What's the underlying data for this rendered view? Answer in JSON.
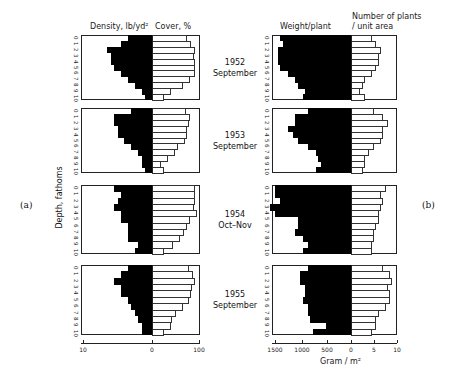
{
  "figure": {
    "panel_a_label": "(a)",
    "panel_b_label": "(b)",
    "y_axis_label": "Depth, fathoms",
    "left_header_density": "Density, lb/yd²",
    "left_header_cover": "Cover, %",
    "right_header_weight": "Weight/plant",
    "right_header_number_line1": "Number of plants",
    "right_header_number_line2": "/ unit area",
    "right_x_label": "Gram / m²",
    "depth_ticks": [
      "0",
      "1",
      "2",
      "3",
      "4",
      "5",
      "6",
      "7",
      "8",
      "9",
      "10"
    ],
    "left_x_ticks": [
      {
        "label": "10",
        "x": 83
      },
      {
        "label": "0",
        "x": 152
      },
      {
        "label": "100",
        "x": 199
      }
    ],
    "right_x_ticks": [
      {
        "label": "1500",
        "x": 275
      },
      {
        "label": "1000",
        "x": 302
      },
      {
        "label": "500",
        "x": 327
      },
      {
        "label": "0",
        "x": 351
      },
      {
        "label": "5",
        "x": 374
      },
      {
        "label": "10",
        "x": 397
      }
    ],
    "dates": [
      {
        "year": "1952",
        "period": "September"
      },
      {
        "year": "1953",
        "period": "September"
      },
      {
        "year": "1954",
        "period": "Oct–Nov"
      },
      {
        "year": "1955",
        "period": "September"
      }
    ]
  },
  "chart_data": [
    {
      "type": "bar",
      "title": "(a) Density (lb/yd²) and Cover (%) by depth",
      "orientation": "horizontal",
      "ylabel": "Depth, fathoms",
      "categories": [
        "0",
        "1",
        "2",
        "3",
        "4",
        "5",
        "6",
        "7",
        "8",
        "9",
        "10"
      ],
      "xlim_density": [
        0,
        10
      ],
      "xlim_cover": [
        0,
        100
      ],
      "panels": [
        {
          "label": "1952 September",
          "series": [
            {
              "name": "Density, lb/yd²",
              "values": [
                3.5,
                4.5,
                6.5,
                6.0,
                6.0,
                5.5,
                4.5,
                3.5,
                2.5,
                1.5,
                1.0
              ]
            },
            {
              "name": "Cover, %",
              "values": [
                75,
                82,
                92,
                90,
                92,
                92,
                92,
                80,
                65,
                40,
                25
              ]
            }
          ]
        },
        {
          "label": "1953 September",
          "series": [
            {
              "name": "Density, lb/yd²",
              "values": [
                3.0,
                5.5,
                5.5,
                5.0,
                5.0,
                4.0,
                3.0,
                2.0,
                1.5,
                1.5,
                1.0
              ]
            },
            {
              "name": "Cover, %",
              "values": [
                72,
                80,
                78,
                75,
                75,
                70,
                55,
                48,
                35,
                20,
                25
              ]
            }
          ]
        },
        {
          "label": "1954 Oct-Nov",
          "series": [
            {
              "name": "Density, lb/yd²",
              "values": [
                5.5,
                4.5,
                5.0,
                5.5,
                4.5,
                4.5,
                3.5,
                3.5,
                3.5,
                2.0,
                2.5
              ]
            },
            {
              "name": "Cover, %",
              "values": [
                92,
                92,
                92,
                90,
                95,
                80,
                75,
                68,
                60,
                45,
                25
              ]
            }
          ]
        },
        {
          "label": "1955 September",
          "series": [
            {
              "name": "Density, lb/yd²",
              "values": [
                3.5,
                4.5,
                5.5,
                4.5,
                4.5,
                3.5,
                3.0,
                2.5,
                2.0,
                1.5,
                1.5
              ]
            },
            {
              "name": "Cover, %",
              "values": [
                78,
                88,
                92,
                85,
                82,
                78,
                65,
                50,
                42,
                40,
                25
              ]
            }
          ]
        }
      ]
    },
    {
      "type": "bar",
      "title": "(b) Weight/plant (Gram/m²) and Number of plants / unit area by depth",
      "orientation": "horizontal",
      "ylabel": "Depth, fathoms",
      "xlabel": "Gram / m²",
      "categories": [
        "0",
        "1",
        "2",
        "3",
        "4",
        "5",
        "6",
        "7",
        "8",
        "9",
        "10"
      ],
      "xlim_weight": [
        0,
        1500
      ],
      "xlim_number": [
        0,
        10
      ],
      "panels": [
        {
          "label": "1952 September",
          "series": [
            {
              "name": "Weight/plant",
              "values": [
                1400,
                1350,
                1450,
                1450,
                1450,
                1400,
                1250,
                1100,
                1050,
                900,
                950
              ]
            },
            {
              "name": "Number of plants / unit area",
              "values": [
                4.5,
                5.5,
                6.5,
                6.0,
                6.0,
                5.5,
                4.5,
                3.0,
                2.5,
                2.0,
                3.0
              ]
            }
          ]
        },
        {
          "label": "1953 September",
          "series": [
            {
              "name": "Weight/plant",
              "values": [
                850,
                1100,
                1100,
                1250,
                1150,
                1050,
                850,
                700,
                650,
                600,
                700
              ]
            },
            {
              "name": "Number of plants / unit area",
              "values": [
                5.0,
                7.0,
                8.0,
                7.0,
                7.0,
                6.5,
                5.0,
                4.0,
                3.0,
                3.0,
                2.5
              ]
            }
          ]
        },
        {
          "label": "1954 Oct-Nov",
          "series": [
            {
              "name": "Weight/plant",
              "values": [
                1500,
                1500,
                1400,
                1600,
                1500,
                1050,
                1050,
                1100,
                950,
                850,
                950
              ]
            },
            {
              "name": "Number of plants / unit area",
              "values": [
                7.5,
                6.5,
                7.0,
                6.5,
                6.0,
                6.0,
                5.5,
                5.0,
                5.0,
                4.5,
                4.5
              ]
            }
          ]
        },
        {
          "label": "1955 September",
          "series": [
            {
              "name": "Weight/plant",
              "values": [
                850,
                1000,
                1000,
                900,
                900,
                950,
                850,
                850,
                800,
                500,
                750
              ]
            },
            {
              "name": "Number of plants / unit area",
              "values": [
                7.0,
                8.5,
                9.0,
                8.0,
                8.5,
                8.5,
                7.5,
                6.0,
                5.5,
                5.5,
                4.5
              ]
            }
          ]
        }
      ]
    }
  ]
}
